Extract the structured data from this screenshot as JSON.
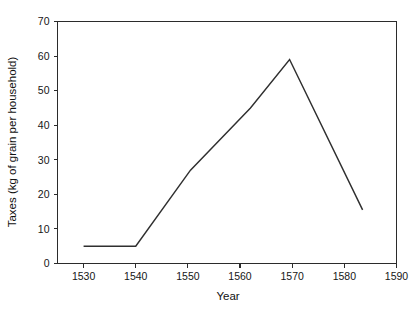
{
  "chart_data": {
    "type": "line",
    "title": "",
    "xlabel": "Year",
    "ylabel": "Taxes (kg of grain per household)",
    "xlim": [
      1525,
      1590
    ],
    "ylim": [
      0,
      70
    ],
    "xticks": [
      1530,
      1540,
      1550,
      1560,
      1570,
      1580,
      1590
    ],
    "xtick_labels": [
      "1530",
      "1540",
      "1550",
      "1560",
      "1570",
      "1580",
      "1590"
    ],
    "yticks": [
      0,
      10,
      20,
      30,
      40,
      50,
      60,
      70
    ],
    "ytick_labels": [
      "0",
      "10",
      "20",
      "30",
      "40",
      "50",
      "60",
      "70"
    ],
    "grid": false,
    "legend": null,
    "series": [
      {
        "name": "Taxes",
        "color": "#2f2f2f",
        "x": [
          1530.0,
          1540.0,
          1550.5,
          1562.0,
          1569.5,
          1583.5
        ],
        "y": [
          5.0,
          5.0,
          27.0,
          45.0,
          59.0,
          15.5
        ],
        "points": [
          {
            "x": 1530.0,
            "y": 5.0
          },
          {
            "x": 1540.0,
            "y": 5.0
          },
          {
            "x": 1550.5,
            "y": 27.0
          },
          {
            "x": 1562.0,
            "y": 45.0
          },
          {
            "x": 1569.5,
            "y": 59.0
          },
          {
            "x": 1583.5,
            "y": 15.5
          }
        ]
      }
    ]
  },
  "axes": {
    "y_axis_title": "Taxes (kg of grain per household)",
    "x_axis_title": "Year"
  }
}
